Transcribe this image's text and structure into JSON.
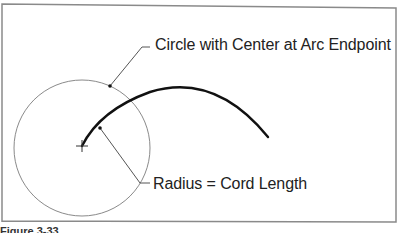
{
  "diagram": {
    "labels": {
      "circle_label": "Circle with Center at Arc Endpoint",
      "radius_label": "Radius = Cord Length"
    },
    "caption": "Figure 3-33",
    "shapes": {
      "frame": {
        "x1": 2,
        "y1": 4,
        "x2": 396,
        "y2": 222,
        "stroke": "#888888"
      },
      "circle": {
        "cx": 82,
        "cy": 148,
        "r": 68,
        "stroke": "#888888"
      },
      "arc": {
        "start": [
          82,
          146
        ],
        "end": [
          268,
          137
        ],
        "stroke": "#111111"
      },
      "center_mark": {
        "x": 82,
        "y": 146
      }
    },
    "colors": {
      "text": "#222222",
      "thin_line": "#888888",
      "thick_arc": "#111111"
    }
  }
}
